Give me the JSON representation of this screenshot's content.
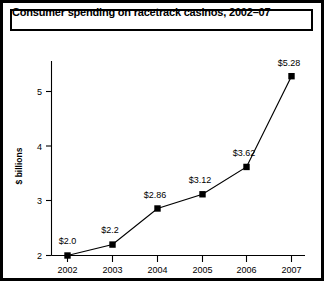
{
  "chart_title": "Consumer spending on racetrack casinos, 2002–07",
  "axes": {
    "ylabel": "$ billions",
    "xlabel": "",
    "yticks": [
      "2",
      "3",
      "4",
      "5"
    ],
    "ytick_values": [
      2,
      3,
      4,
      5
    ],
    "xticks": [
      "2002",
      "2003",
      "2004",
      "2005",
      "2006",
      "2007"
    ]
  },
  "point_labels": [
    "$2.0",
    "$2.2",
    "$2.86",
    "$3.12",
    "$3.62",
    "$5.28"
  ],
  "colors": {
    "line": "#000000",
    "marker": "#000000",
    "axis": "#000000",
    "background": "#ffffff",
    "border": "#000000"
  },
  "chart_data": {
    "type": "line",
    "title": "Consumer spending on racetrack casinos, 2002–07",
    "xlabel": "",
    "ylabel": "$ billions",
    "categories": [
      "2002",
      "2003",
      "2004",
      "2005",
      "2006",
      "2007"
    ],
    "x": [
      2002,
      2003,
      2004,
      2005,
      2006,
      2007
    ],
    "values": [
      2.0,
      2.2,
      2.86,
      3.12,
      3.62,
      5.28
    ],
    "data_labels": [
      "$2.0",
      "$2.2",
      "$2.86",
      "$3.12",
      "$3.62",
      "$5.28"
    ],
    "ylim": [
      2,
      5.6
    ],
    "yticks": [
      2,
      3,
      4,
      5
    ],
    "grid": false,
    "legend": false,
    "marker": "square",
    "units": "billions of US dollars"
  }
}
